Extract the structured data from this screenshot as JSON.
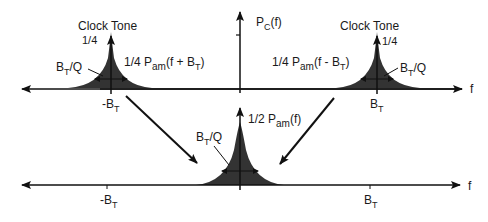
{
  "diagram": {
    "top_panel": {
      "axis_label_y": "P",
      "axis_label_y_sub": "C",
      "axis_label_y_arg": "(f)",
      "axis_label_x": "f",
      "left_peak": {
        "tone_label": "Clock Tone",
        "tone_value": "1/4",
        "bandwidth_label": "B",
        "bandwidth_sub": "T",
        "bandwidth_suffix": "/Q",
        "psd_coeff": "1/4 P",
        "psd_sub": "am",
        "psd_arg": "(f + B",
        "psd_arg_sub": "T",
        "psd_arg_end": ")",
        "freq_label": "-B",
        "freq_sub": "T"
      },
      "right_peak": {
        "tone_label": "Clock Tone",
        "tone_value": "1/4",
        "bandwidth_label": "B",
        "bandwidth_sub": "T",
        "bandwidth_suffix": "/Q",
        "psd_coeff": "1/4 P",
        "psd_sub": "am",
        "psd_arg": "(f - B",
        "psd_arg_sub": "T",
        "psd_arg_end": ")",
        "freq_label": "B",
        "freq_sub": "T"
      }
    },
    "bottom_panel": {
      "axis_label_x": "f",
      "center_peak": {
        "bandwidth_label": "B",
        "bandwidth_sub": "T",
        "bandwidth_suffix": "/Q",
        "psd_coeff": "1/2 P",
        "psd_sub": "am",
        "psd_arg": "(f)"
      },
      "left_tick": {
        "label": "-B",
        "sub": "T"
      },
      "right_tick": {
        "label": "B",
        "sub": "T"
      }
    },
    "colors": {
      "fill": "#333333",
      "line": "#111111"
    }
  }
}
